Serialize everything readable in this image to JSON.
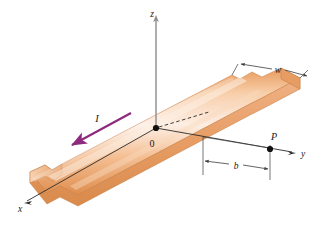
{
  "figure": {
    "type": "physics-diagram",
    "background_color": "#ffffff"
  },
  "axes": {
    "z": {
      "label": "z",
      "direction": "up",
      "label_x": 152,
      "label_y": 13
    },
    "y": {
      "label": "y",
      "direction": "right",
      "label_x": 303,
      "label_y": 155
    },
    "x": {
      "label": "x",
      "direction": "down-left-front",
      "label_x": 20,
      "label_y": 210
    },
    "origin": {
      "label": "0",
      "label_x": 152,
      "label_y": 146,
      "point_x": 156,
      "point_y": 128
    }
  },
  "labels": {
    "current": "I",
    "width": "w",
    "distance": "b",
    "point": "P"
  },
  "current_arrow": {
    "symbol": "I",
    "color": "#8e2a7e",
    "label_x": 95,
    "label_y": 122,
    "from_x": 131,
    "from_y": 113,
    "to_x": 68,
    "to_y": 147
  },
  "width_dimension": {
    "symbol": "w",
    "label_x": 277,
    "label_y": 72,
    "color": "#3c3c3c"
  },
  "distance_dimension": {
    "symbol": "b",
    "label_x": 236,
    "label_y": 165,
    "color": "#3c3c3c"
  },
  "point_p": {
    "symbol": "P",
    "label_x": 276,
    "label_y": 140,
    "dot_x": 270,
    "dot_y": 152
  },
  "ribbon": {
    "material": "copper",
    "top_face_light": "#fbe2cf",
    "top_face_mid": "#f0b183",
    "top_face_dark": "#e2985f",
    "edge_color": "#d98c4e",
    "side_face": "#e8a870",
    "outline_color": "#c07a3c"
  },
  "colors": {
    "axis_line": "#8c8c8c",
    "center_line": "#2b2b2b",
    "dimension_line": "#3c3c3c",
    "current": "#8e2a7e",
    "dot": "#111111"
  },
  "watermark": {
    "text": ""
  }
}
